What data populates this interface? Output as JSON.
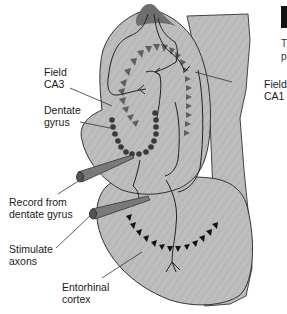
{
  "figure": {
    "corner_box_color": "#111111",
    "partial_caption": "Th\npu",
    "colors": {
      "tissue_fill": "#bdbdbd",
      "tissue_dark": "#6e6e6e",
      "pyramidal_cells": "#5f5f5f",
      "granule_cells": "#3a3a3a",
      "entorhinal_cells": "#111111",
      "outline": "#333333",
      "electrode": "#7a7a7a"
    }
  },
  "labels": {
    "field_ca3": "Field\nCA3",
    "dentate_gyrus": "Dentate\ngyrus",
    "field_ca1": "Field\nCA1",
    "record": "Record from\ndentate gyrus",
    "stimulate": "Stimulate\naxons",
    "entorhinal": "Entorhinal\ncortex"
  }
}
